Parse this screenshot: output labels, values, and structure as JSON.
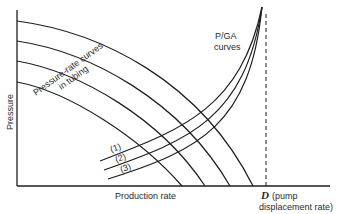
{
  "diagram": {
    "y_axis_label": "Pressure",
    "x_axis_label": "Production rate",
    "tubing_curves_label_line1": "Pressure-rate curves",
    "tubing_curves_label_line2": "in tubing",
    "pga_label_line1": "P/GA",
    "pga_label_line2": "curves",
    "d_symbol": "D",
    "d_label_line1": "(pump",
    "d_label_line2": "displacement rate)",
    "pga_curve_labels": [
      "(1)",
      "(2)",
      "(3)"
    ],
    "colors": {
      "line": "#1e1e1e",
      "text": "#2a2a2a",
      "background": "#ffffff"
    }
  }
}
